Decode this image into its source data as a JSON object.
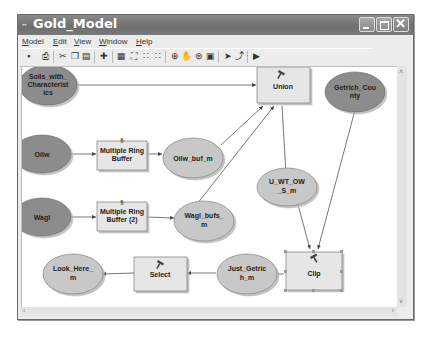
{
  "window": {
    "title": "Gold_Model",
    "title_icon": "··",
    "controls": [
      "minimize",
      "maximize",
      "close"
    ]
  },
  "menu": {
    "items": [
      {
        "label": "Model",
        "accel": "M"
      },
      {
        "label": "Edit",
        "accel": "E"
      },
      {
        "label": "View",
        "accel": "V"
      },
      {
        "label": "Window",
        "accel": "W"
      },
      {
        "label": "Help",
        "accel": "H"
      }
    ]
  },
  "toolbar": {
    "tools": [
      {
        "name": "save-icon",
        "glyph": "▪"
      },
      {
        "name": "print-icon",
        "glyph": "⎙"
      },
      {
        "name": "cut-icon",
        "glyph": "✂"
      },
      {
        "name": "copy-icon",
        "glyph": "❐"
      },
      {
        "name": "paste-icon",
        "glyph": "▤"
      },
      {
        "name": "add-data-icon",
        "glyph": "✚"
      },
      {
        "name": "auto-layout-icon",
        "glyph": "▦"
      },
      {
        "name": "full-extent-icon",
        "glyph": "⛶"
      },
      {
        "name": "fixed-zoom-in-icon",
        "glyph": "∷"
      },
      {
        "name": "fixed-zoom-out-icon",
        "glyph": "∷"
      },
      {
        "name": "zoom-in-icon",
        "glyph": "⊕"
      },
      {
        "name": "pan-icon",
        "glyph": "✋"
      },
      {
        "name": "overview-icon",
        "glyph": "⊛"
      },
      {
        "name": "properties-icon",
        "glyph": "▣"
      },
      {
        "name": "select-icon",
        "glyph": "➤"
      },
      {
        "name": "connect-icon",
        "glyph": "⤴"
      },
      {
        "name": "run-icon",
        "glyph": "▶"
      }
    ]
  },
  "diagram": {
    "data_nodes": [
      {
        "id": "soils",
        "label_lines": [
          "Soils_with_",
          "Characterist",
          "ics"
        ],
        "type": "input"
      },
      {
        "id": "oilw",
        "label_lines": [
          "Oilw"
        ],
        "type": "input"
      },
      {
        "id": "wagl",
        "label_lines": [
          "Wagl"
        ],
        "type": "input"
      },
      {
        "id": "getrich",
        "label_lines": [
          "Getrich_Cou",
          "nty"
        ],
        "type": "input"
      },
      {
        "id": "oilw_buf",
        "label_lines": [
          "Oilw_buf_m"
        ],
        "type": "derived"
      },
      {
        "id": "wagl_bufs",
        "label_lines": [
          "Wagl_bufs_",
          "m"
        ],
        "type": "derived"
      },
      {
        "id": "u_wt",
        "label_lines": [
          "U_WT_OW",
          "_S_m"
        ],
        "type": "derived"
      },
      {
        "id": "just_getrich",
        "label_lines": [
          "Just_Getric",
          "h_m"
        ],
        "type": "derived"
      },
      {
        "id": "look_here",
        "label_lines": [
          "Look_Here_",
          "m"
        ],
        "type": "derived"
      }
    ],
    "tool_nodes": [
      {
        "id": "mrb1",
        "label_lines": [
          "Multiple Ring",
          "Buffer"
        ],
        "icon": "script-icon"
      },
      {
        "id": "mrb2",
        "label_lines": [
          "Multiple Ring",
          "Buffer (2)"
        ],
        "icon": "script-icon"
      },
      {
        "id": "union",
        "label_lines": [
          "Union"
        ],
        "icon": "hammer-icon"
      },
      {
        "id": "clip",
        "label_lines": [
          "Clip"
        ],
        "icon": "hammer-icon",
        "selected": true
      },
      {
        "id": "select",
        "label_lines": [
          "Select"
        ],
        "icon": "hammer-icon"
      }
    ],
    "colors": {
      "input_fill": "#8c8c8c",
      "derived_fill": "#c8c8c8",
      "tool_fill": "#e6e6e6",
      "connector": "#555555"
    }
  },
  "scrollbars": {
    "vertical": {
      "up": "˄",
      "down": "˅"
    },
    "horizontal": {
      "left": "‹",
      "right": "›"
    }
  }
}
